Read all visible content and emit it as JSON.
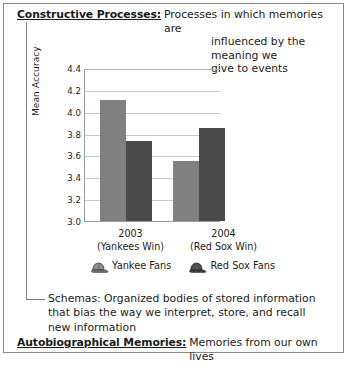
{
  "figure": {
    "terms": [
      {
        "id": "constructive-processes",
        "term": "Constructive Processes:",
        "underlined": true,
        "lines": [
          "Processes in which memories are",
          "influenced by the meaning we",
          "give to events"
        ]
      },
      {
        "id": "schemas",
        "term": "Schemas:",
        "underlined": false,
        "lines": [
          "Organized bodies of stored information",
          "that bias the way we interpret, store, and recall",
          "new information"
        ]
      },
      {
        "id": "autobiographical-memories",
        "term": "Autobiographical Memories:",
        "underlined": true,
        "lines": [
          "Memories from our own lives"
        ]
      }
    ]
  },
  "chart_data": {
    "type": "bar",
    "title": "",
    "xlabel": "",
    "ylabel": "Mean Accuracy",
    "ylim": [
      3.0,
      4.4
    ],
    "ytick_step": 0.2,
    "yticks": [
      "4.4",
      "4.2",
      "4.0",
      "3.8",
      "3.6",
      "3.4",
      "3.2",
      "3.0"
    ],
    "grid": true,
    "legend_position": "below",
    "categories": [
      "2003",
      "2004"
    ],
    "category_sublabels": [
      "(Yankees Win)",
      "(Red Sox Win)"
    ],
    "series": [
      {
        "name": "Yankee Fans",
        "color": "#808080",
        "icon": "baseball-cap-icon",
        "values": [
          4.11,
          3.55
        ]
      },
      {
        "name": "Red Sox Fans",
        "color": "#4a4a4a",
        "icon": "baseball-cap-icon",
        "values": [
          3.73,
          3.85
        ]
      }
    ]
  }
}
